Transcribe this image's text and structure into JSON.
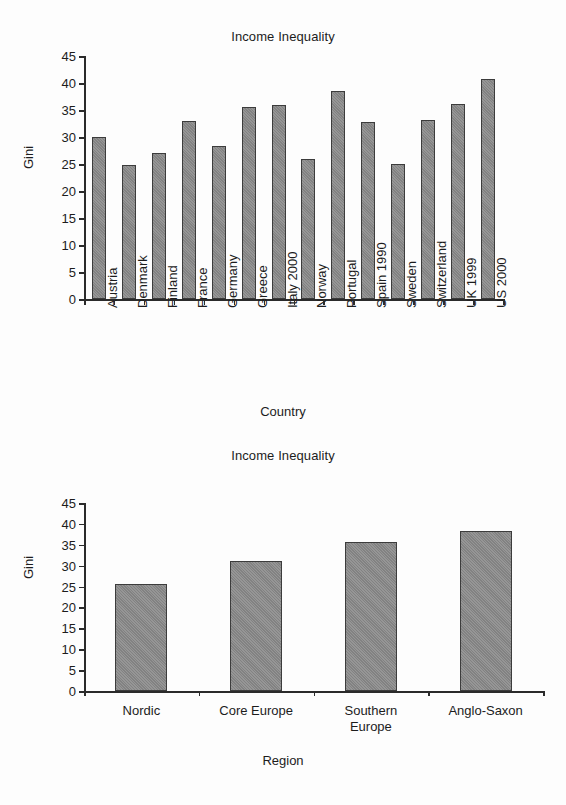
{
  "document": {
    "background_color": "#fdfdfd",
    "bar_color": "#8a8a8a",
    "bar_edge_color": "#3c3c3c",
    "axis_color": "#2b2b2b"
  },
  "charts": [
    {
      "id": "country-chart",
      "title": "Income Inequality",
      "ylabel": "Gini",
      "xlabel": "Country"
    },
    {
      "id": "region-chart",
      "title": "Income Inequality",
      "ylabel": "Gini",
      "xlabel": "Region"
    }
  ],
  "chart_data": [
    {
      "type": "bar",
      "title": "Income Inequality",
      "xlabel": "Country",
      "ylabel": "Gini",
      "ylim": [
        0,
        45
      ],
      "yticks": [
        0,
        5,
        10,
        15,
        20,
        25,
        30,
        35,
        40,
        45
      ],
      "ytick_labels": [
        "0",
        "5",
        "10",
        "15",
        "20",
        "25",
        "30",
        "35",
        "40",
        "45"
      ],
      "grid": false,
      "legend": "none",
      "xtick_rotation": -90,
      "categories": [
        "Austria",
        "Denmark",
        "Finland",
        "France",
        "Germany",
        "Greece",
        "Italy 2000",
        "Norway",
        "Portugal",
        "Spain 1990",
        "Sweden",
        "Switzerland",
        "UK 1999",
        "US 2000"
      ],
      "values": [
        30.0,
        24.8,
        27.0,
        32.9,
        28.4,
        35.5,
        36.0,
        26.0,
        38.6,
        32.7,
        25.0,
        33.2,
        36.1,
        40.8
      ]
    },
    {
      "type": "bar",
      "title": "Income Inequality",
      "xlabel": "Region",
      "ylabel": "Gini",
      "ylim": [
        0,
        45
      ],
      "yticks": [
        0,
        5,
        10,
        15,
        20,
        25,
        30,
        35,
        40,
        45
      ],
      "ytick_labels": [
        "0",
        "5",
        "10",
        "15",
        "20",
        "25",
        "30",
        "35",
        "40",
        "45"
      ],
      "grid": false,
      "legend": "none",
      "xtick_rotation": 0,
      "categories": [
        "Nordic",
        "Core Europe",
        "Southern\nEurope",
        "Anglo-Saxon"
      ],
      "values": [
        25.6,
        31.0,
        35.7,
        38.4
      ]
    }
  ]
}
